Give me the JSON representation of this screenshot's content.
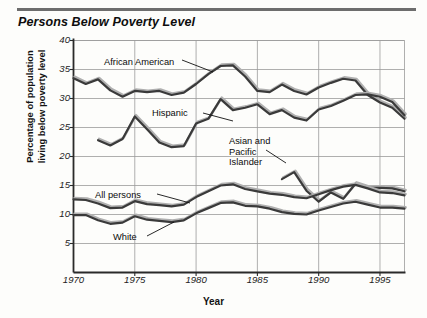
{
  "figure": {
    "title": "Persons Below Poverty Level",
    "xlabel": "Year",
    "ylabel_line1": "Percentage of population",
    "ylabel_line2": "living below poverty level"
  },
  "axes": {
    "yticks": [
      "5",
      "10",
      "15",
      "20",
      "25",
      "30",
      "35",
      "40"
    ],
    "xticks": [
      "1970",
      "1975",
      "1980",
      "1985",
      "1990",
      "1995"
    ]
  },
  "annotations": {
    "african_american": "African American",
    "hispanic": "Hispanic",
    "asian_line1": "Asian and",
    "asian_line2": "Pacific",
    "asian_line3": "Islander",
    "all_persons": "All persons",
    "white": "White"
  },
  "colors": {
    "line": "#3a3a3a",
    "shadow": "#b0b0b0",
    "grid": "#9a9a9a",
    "axis": "#2a2a2a",
    "background": "#fdfdfb",
    "rule": "#6d6d6d"
  },
  "chart_data": {
    "type": "line",
    "title": "Persons Below Poverty Level",
    "xlabel": "Year",
    "ylabel": "Percentage of population living below poverty level",
    "xlim": [
      1970,
      1997
    ],
    "ylim": [
      0,
      40
    ],
    "xticks": [
      1970,
      1975,
      1980,
      1985,
      1990,
      1995
    ],
    "yticks": [
      5,
      10,
      15,
      20,
      25,
      30,
      35,
      40
    ],
    "grid": true,
    "legend": "inline-annotations",
    "series": [
      {
        "name": "African American",
        "x": [
          1970,
          1971,
          1972,
          1973,
          1974,
          1975,
          1976,
          1977,
          1978,
          1979,
          1980,
          1981,
          1982,
          1983,
          1984,
          1985,
          1986,
          1987,
          1988,
          1989,
          1990,
          1991,
          1992,
          1993,
          1994,
          1995,
          1996,
          1997
        ],
        "values": [
          33.5,
          32.5,
          33.3,
          31.4,
          30.3,
          31.3,
          31.1,
          31.3,
          30.6,
          31.0,
          32.5,
          34.2,
          35.6,
          35.7,
          33.8,
          31.3,
          31.1,
          32.4,
          31.3,
          30.7,
          31.9,
          32.7,
          33.4,
          33.1,
          30.6,
          29.3,
          28.4,
          26.5
        ]
      },
      {
        "name": "Hispanic",
        "x": [
          1972,
          1973,
          1974,
          1975,
          1976,
          1977,
          1978,
          1979,
          1980,
          1981,
          1982,
          1983,
          1984,
          1985,
          1986,
          1987,
          1988,
          1989,
          1990,
          1991,
          1992,
          1993,
          1994,
          1995,
          1996,
          1997
        ],
        "values": [
          22.8,
          21.9,
          23.0,
          26.9,
          24.7,
          22.4,
          21.6,
          21.8,
          25.7,
          26.5,
          29.9,
          28.0,
          28.4,
          29.0,
          27.3,
          28.0,
          26.7,
          26.2,
          28.1,
          28.7,
          29.6,
          30.6,
          30.7,
          30.3,
          29.4,
          27.1
        ]
      },
      {
        "name": "Asian and Pacific Islander",
        "x": [
          1987,
          1988,
          1989,
          1990,
          1991,
          1992,
          1993,
          1994,
          1995,
          1996,
          1997
        ],
        "values": [
          16.1,
          17.3,
          14.1,
          12.2,
          13.8,
          12.7,
          15.3,
          14.6,
          14.6,
          14.5,
          14.0
        ]
      },
      {
        "name": "All persons",
        "x": [
          1970,
          1971,
          1972,
          1973,
          1974,
          1975,
          1976,
          1977,
          1978,
          1979,
          1980,
          1981,
          1982,
          1983,
          1984,
          1985,
          1986,
          1987,
          1988,
          1989,
          1990,
          1991,
          1992,
          1993,
          1994,
          1995,
          1996,
          1997
        ],
        "values": [
          12.6,
          12.5,
          11.9,
          11.1,
          11.2,
          12.3,
          11.8,
          11.6,
          11.4,
          11.7,
          13.0,
          14.0,
          15.0,
          15.2,
          14.4,
          14.0,
          13.6,
          13.4,
          13.0,
          12.8,
          13.5,
          14.2,
          14.8,
          15.1,
          14.5,
          13.8,
          13.7,
          13.3
        ]
      },
      {
        "name": "White",
        "x": [
          1970,
          1971,
          1972,
          1973,
          1974,
          1975,
          1976,
          1977,
          1978,
          1979,
          1980,
          1981,
          1982,
          1983,
          1984,
          1985,
          1986,
          1987,
          1988,
          1989,
          1990,
          1991,
          1992,
          1993,
          1994,
          1995,
          1996,
          1997
        ],
        "values": [
          9.9,
          9.9,
          9.0,
          8.4,
          8.6,
          9.7,
          9.1,
          8.9,
          8.7,
          9.0,
          10.2,
          11.1,
          12.0,
          12.1,
          11.5,
          11.4,
          11.0,
          10.4,
          10.1,
          10.0,
          10.7,
          11.3,
          11.9,
          12.2,
          11.7,
          11.2,
          11.2,
          11.0
        ]
      }
    ]
  }
}
